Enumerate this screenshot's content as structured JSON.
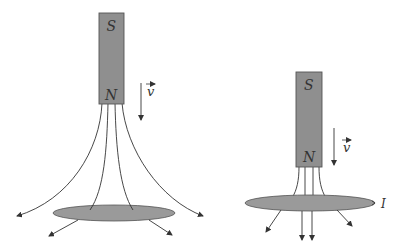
{
  "diagram": {
    "type": "physics-illustration",
    "colors": {
      "magnet_fill": "#8f8f8f",
      "magnet_stroke": "#555555",
      "ring_fill": "#9a9a9a",
      "line_color": "#333333",
      "background": "#ffffff"
    },
    "left_panel": {
      "magnet": {
        "top_pole": "S",
        "bottom_pole": "N"
      },
      "velocity_label": "v",
      "description": "Magnet far from ring; field lines spread out, most pass outside the ring"
    },
    "right_panel": {
      "magnet": {
        "top_pole": "S",
        "bottom_pole": "N"
      },
      "velocity_label": "v",
      "current_label": "I",
      "description": "Magnet close to ring; field lines pass through ring, induced current I"
    }
  }
}
